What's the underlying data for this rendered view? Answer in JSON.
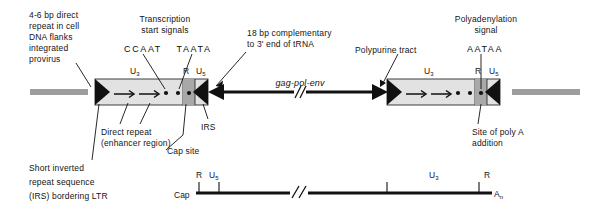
{
  "figure": {
    "title_text": "Retroviral provirus LTR structure diagram",
    "colors": {
      "flank_gray": "#9d9d9d",
      "ltr_light": "#e2e2e2",
      "ltr_mid": "#d2d2d2",
      "r_region": "#a8a8a8",
      "black": "#111111",
      "white": "#ffffff"
    }
  },
  "annotations": {
    "left_flank": {
      "lines": [
        "4-6 bp direct",
        "repeat in cell",
        "DNA flanks",
        "integrated",
        "provirus"
      ]
    },
    "transcription_start": {
      "lines": [
        "Transcription",
        "start signals"
      ],
      "sequence_ccaat": "CCAAT",
      "sequence_taata": "TAATA"
    },
    "complementary": {
      "lines": [
        "18 bp complementary",
        "to 3' end of tRNA"
      ]
    },
    "polypurine": {
      "label": "Polypurine tract"
    },
    "polyadenylation": {
      "lines": [
        "Polyadenylation",
        "signal"
      ],
      "sequence_aataa": "AATAA"
    },
    "direct_repeat": {
      "lines": [
        "Direct repeat",
        "(enhancer region)"
      ]
    },
    "cap_site": {
      "label": "Cap site"
    },
    "irs_callout": {
      "label": "IRS"
    },
    "short_inverted": {
      "lines": [
        "Short inverted",
        "repeat sequence",
        "(IRS) bordering LTR"
      ]
    },
    "poly_a_site": {
      "lines": [
        "Site of poly A",
        "addition"
      ]
    }
  },
  "provirus": {
    "gene_label": "gag-pol-env",
    "left_ltr": {
      "u3_label": "U",
      "u3_sub": "3",
      "r_label": "R",
      "u5_label": "U",
      "u5_sub": "5"
    },
    "right_ltr": {
      "u3_label": "U",
      "u3_sub": "3",
      "r_label": "R",
      "u5_label": "U",
      "u5_sub": "5"
    }
  },
  "transcript": {
    "cap_label": "Cap",
    "r_left_label": "R",
    "u5_label": "U",
    "u5_sub": "5",
    "u3_label": "U",
    "u3_sub": "3",
    "r_right_label": "R",
    "an_label": "A",
    "an_sub": "n"
  }
}
